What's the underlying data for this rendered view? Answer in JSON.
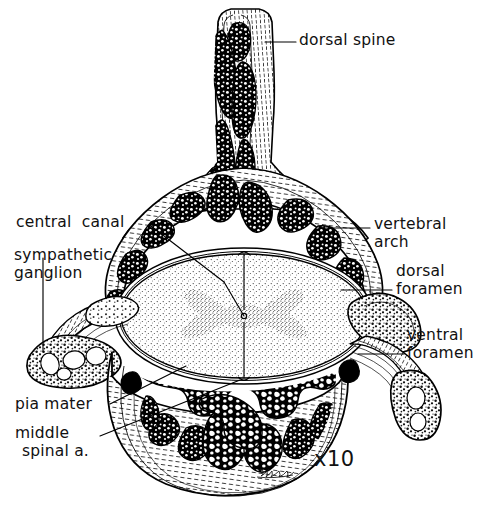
{
  "figure": {
    "kind": "anatomical-illustration",
    "magnification": "x10",
    "background_color": "#ffffff",
    "ink_color": "#000000",
    "signature": "artist-signature"
  },
  "labels": {
    "dorsal_spine": "dorsal spine",
    "central_canal": "central  canal",
    "sympathetic_ganglion_l1": "sympathetic",
    "sympathetic_ganglion_l2": "ganglion",
    "vertebral_arch_l1": "vertebral",
    "vertebral_arch_l2": "arch",
    "dorsal_foramen_l1": "dorsal",
    "dorsal_foramen_l2": "foramen",
    "ventral_foramen_l1": "ventral",
    "ventral_foramen_l2": "foramen",
    "pia_mater": "pia mater",
    "middle_spinal_a_l1": "middle",
    "middle_spinal_a_l2": "spinal a.",
    "magnification": "x10"
  },
  "structures": [
    {
      "name": "dorsal-spine",
      "description": "tall dorsal spinous process with cancellous bone"
    },
    {
      "name": "vertebral-arch",
      "description": "neural arch forming roof of vertebral canal"
    },
    {
      "name": "spinal-cord",
      "description": "oval stippled cord with butterfly gray matter"
    },
    {
      "name": "central-canal",
      "description": "tiny central dot in the middle of the cord"
    },
    {
      "name": "vertebral-body",
      "description": "ventral mass of dense trabecular bone"
    },
    {
      "name": "sympathetic-ganglion-left",
      "description": "oval ganglion on left transverse process"
    },
    {
      "name": "sympathetic-ganglion-right",
      "description": "oval ganglion on right transverse process"
    },
    {
      "name": "dorsal-foramen-right",
      "description": "dorsal nerve root exit"
    },
    {
      "name": "ventral-foramen-right",
      "description": "ventral nerve root exit"
    },
    {
      "name": "pia-mater",
      "description": "membrane closely investing the cord"
    },
    {
      "name": "middle-spinal-artery",
      "description": "vessel at ventral midline of the cord"
    }
  ]
}
